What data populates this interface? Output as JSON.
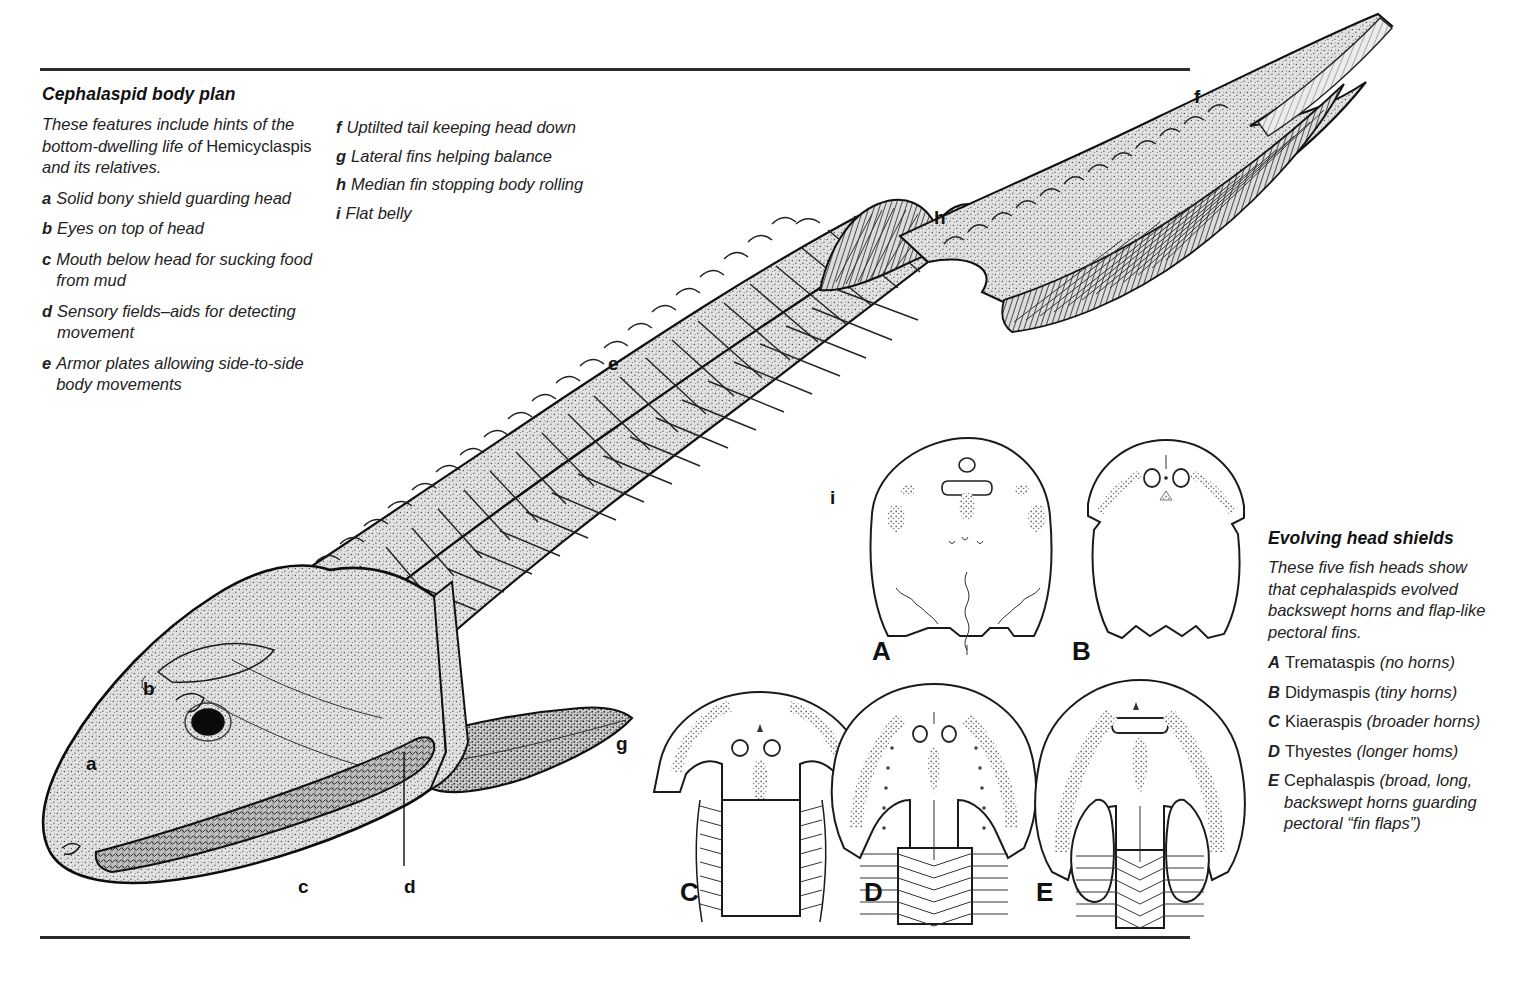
{
  "figure": {
    "kind": "scientific-illustration"
  },
  "left_caption": {
    "title": "Cephalaspid body plan",
    "intro_a": "These features include hints of the bottom-dwelling life of ",
    "intro_b": "Hemicyclaspis",
    "intro_c": " and its relatives.",
    "items": [
      {
        "key": "a",
        "text": "Solid bony shield guarding head"
      },
      {
        "key": "b",
        "text": "Eyes on top of head"
      },
      {
        "key": "c",
        "text": "Mouth below head for sucking food from mud"
      },
      {
        "key": "d",
        "text": "Sensory fields–aids for detecting movement"
      },
      {
        "key": "e",
        "text": "Armor plates allowing side-to-side body movements"
      }
    ],
    "items_col2": [
      {
        "key": "f",
        "text": "Uptilted tail keeping head down"
      },
      {
        "key": "g",
        "text": "Lateral fins helping balance"
      },
      {
        "key": "h",
        "text": "Median fin stopping body rolling"
      },
      {
        "key": "i",
        "text": "Flat belly"
      }
    ]
  },
  "right_caption": {
    "title": "Evolving head shields",
    "intro": "These five fish heads show that cephalaspids evolved backswept horns and flap-like pectoral fins.",
    "items": [
      {
        "key": "A",
        "name": "Tremataspis",
        "note": "(no horns)"
      },
      {
        "key": "B",
        "name": "Didymaspis",
        "note": "(tiny horns)"
      },
      {
        "key": "C",
        "name": "Kiaeraspis",
        "note": "(broader horns)"
      },
      {
        "key": "D",
        "name": "Thyestes",
        "note": "(longer homs)"
      },
      {
        "key": "E",
        "name": "Cephalaspis",
        "note": "(broad, long, backswept horns guarding pectoral “fin flaps”)"
      }
    ]
  },
  "fish_labels": [
    {
      "id": "a",
      "text": "a",
      "x": 86,
      "y": 753
    },
    {
      "id": "b",
      "text": "b",
      "x": 143,
      "y": 678
    },
    {
      "id": "c",
      "text": "c",
      "x": 298,
      "y": 876
    },
    {
      "id": "d",
      "text": "d",
      "x": 404,
      "y": 876
    },
    {
      "id": "e",
      "text": "e",
      "x": 608,
      "y": 353
    },
    {
      "id": "f",
      "text": "f",
      "x": 1194,
      "y": 86
    },
    {
      "id": "g",
      "text": "g",
      "x": 616,
      "y": 733
    },
    {
      "id": "h",
      "text": "h",
      "x": 934,
      "y": 207
    },
    {
      "id": "i",
      "text": "i",
      "x": 830,
      "y": 487
    }
  ],
  "shield_labels": [
    {
      "id": "A",
      "text": "A",
      "x": 872,
      "y": 636
    },
    {
      "id": "B",
      "text": "B",
      "x": 1072,
      "y": 636
    },
    {
      "id": "C",
      "text": "C",
      "x": 680,
      "y": 877
    },
    {
      "id": "D",
      "text": "D",
      "x": 864,
      "y": 877
    },
    {
      "id": "E",
      "text": "E",
      "x": 1036,
      "y": 877
    }
  ],
  "colors": {
    "ink": "#1a1a1a",
    "rule": "#2b2b2b",
    "paper": "#ffffff",
    "body_tone": "#d8d8d8"
  }
}
